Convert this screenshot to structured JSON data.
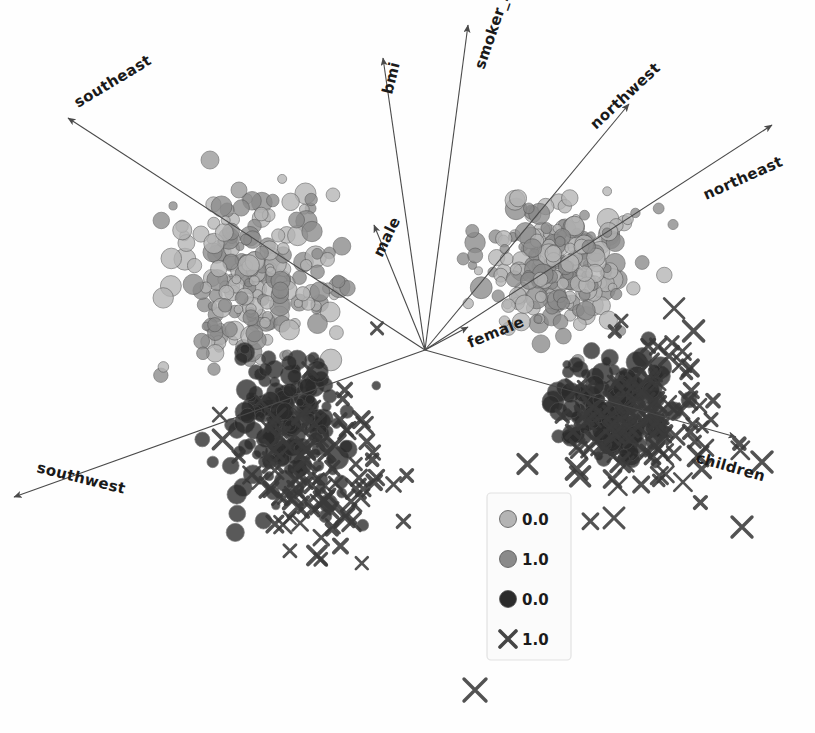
{
  "chart_data": {
    "type": "scatter",
    "title": "",
    "subtitle": "",
    "xlabel": "",
    "ylabel": "",
    "grid": false,
    "axes_visible": false,
    "background_color": "#fefefe",
    "plot_description": "PCA biplot of insurance dataset: grayscale scatter of observations with feature loading vectors",
    "origin": {
      "x": 425,
      "y": 350
    },
    "vectors": [
      {
        "label": "southeast",
        "x2": 68,
        "y2": 118,
        "label_x": 78,
        "label_y": 108,
        "label_rot": -31
      },
      {
        "label": "bmi",
        "x2": 383,
        "y2": 58,
        "label_x": 392,
        "label_y": 95,
        "label_rot": -76
      },
      {
        "label": "smoker_2",
        "x2": 468,
        "y2": 25,
        "label_x": 484,
        "label_y": 70,
        "label_rot": -71
      },
      {
        "label": "northwest",
        "x2": 629,
        "y2": 104,
        "label_x": 596,
        "label_y": 130,
        "label_rot": -43
      },
      {
        "label": "northeast",
        "x2": 772,
        "y2": 125,
        "label_x": 706,
        "label_y": 200,
        "label_rot": -24
      },
      {
        "label": "male",
        "x2": 374,
        "y2": 225,
        "label_x": 382,
        "label_y": 258,
        "label_rot": -64
      },
      {
        "label": "female",
        "x2": 468,
        "y2": 327,
        "label_x": 470,
        "label_y": 348,
        "label_rot": -22
      },
      {
        "label": "southwest",
        "x2": 14,
        "y2": 497,
        "label_x": 36,
        "label_y": 472,
        "label_rot": 14
      },
      {
        "label": "children",
        "x2": 736,
        "y2": 437,
        "label_x": 695,
        "label_y": 462,
        "label_rot": 16
      }
    ],
    "legend": {
      "position": "bottom-center",
      "box": {
        "x": 487,
        "y": 493,
        "w": 84,
        "h": 167
      },
      "entries": [
        {
          "marker": "circle",
          "color": "#b4b4b4",
          "label": "0.0"
        },
        {
          "marker": "circle",
          "color": "#8a8a8a",
          "label": "1.0"
        },
        {
          "marker": "circle",
          "color": "#2b2b2b",
          "label": "0.0"
        },
        {
          "marker": "x",
          "color": "#2b2b2b",
          "label": "1.0"
        }
      ]
    },
    "marker_colors": {
      "light_circle": "#b4b4b4",
      "mid_circle": "#8a8a8a",
      "dark_circle": "#2b2b2b",
      "x_marker": "#3a3a3a",
      "arrow": "#4a4a4a",
      "text": "#1a1a1a"
    },
    "clusters": [
      {
        "name": "left-light-circles",
        "cx": 255,
        "cy": 280,
        "n": 210,
        "color": "#9a9a9a",
        "marker": "circle",
        "spread_x": 85,
        "spread_y": 90
      },
      {
        "name": "left-dark-circles",
        "cx": 290,
        "cy": 430,
        "n": 150,
        "color": "#2b2b2b",
        "marker": "circle",
        "spread_x": 75,
        "spread_y": 95
      },
      {
        "name": "left-x-markers",
        "cx": 320,
        "cy": 480,
        "n": 90,
        "color": "#3a3a3a",
        "marker": "x",
        "spread_x": 85,
        "spread_y": 110
      },
      {
        "name": "right-light-circles",
        "cx": 560,
        "cy": 265,
        "n": 230,
        "color": "#9a9a9a",
        "marker": "circle",
        "spread_x": 85,
        "spread_y": 75
      },
      {
        "name": "right-dark-circles",
        "cx": 615,
        "cy": 410,
        "n": 140,
        "color": "#2b2b2b",
        "marker": "circle",
        "spread_x": 65,
        "spread_y": 60
      },
      {
        "name": "right-x-markers",
        "cx": 640,
        "cy": 420,
        "n": 120,
        "color": "#3a3a3a",
        "marker": "x",
        "spread_x": 85,
        "spread_y": 90
      }
    ],
    "outliers": [
      {
        "x": 475,
        "y": 690,
        "marker": "x",
        "color": "#3a3a3a",
        "size": 11
      },
      {
        "x": 742,
        "y": 527,
        "marker": "x",
        "color": "#3a3a3a",
        "size": 10
      },
      {
        "x": 762,
        "y": 462,
        "marker": "x",
        "color": "#3a3a3a",
        "size": 10
      },
      {
        "x": 210,
        "y": 160,
        "marker": "circle",
        "color": "#9a9a9a",
        "size": 9
      },
      {
        "x": 239,
        "y": 190,
        "marker": "circle",
        "color": "#9a9a9a",
        "size": 8
      }
    ]
  }
}
